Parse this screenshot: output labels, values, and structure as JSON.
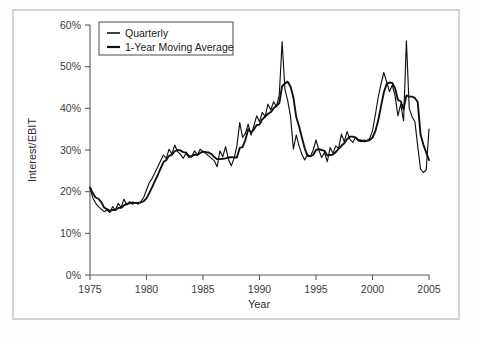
{
  "figure": {
    "background_color": "#ffffff",
    "frame_color": "#d3d3d5",
    "line_color": "#111111"
  },
  "chart_data": {
    "type": "line",
    "title": "",
    "xlabel": "Year",
    "ylabel": "Interest/EBIT",
    "xlim": [
      1975,
      2005
    ],
    "ylim": [
      0,
      60
    ],
    "grid": false,
    "legend_position": "top-left-inside",
    "xticks": [
      1975,
      1980,
      1985,
      1990,
      1995,
      2000,
      2005
    ],
    "xticklabels": [
      "1975",
      "1980",
      "1985",
      "1990",
      "1995",
      "2000",
      "2005"
    ],
    "yticks": [
      0,
      10,
      20,
      30,
      40,
      50,
      60
    ],
    "yticklabels": [
      "0%",
      "10%",
      "20%",
      "30%",
      "40%",
      "50%",
      "60%"
    ],
    "series": [
      {
        "name": "Quarterly",
        "linewidth": 1.15,
        "x": [
          1975.0,
          1975.25,
          1975.5,
          1975.75,
          1976.0,
          1976.25,
          1976.5,
          1976.75,
          1977.0,
          1977.25,
          1977.5,
          1977.75,
          1978.0,
          1978.25,
          1978.5,
          1978.75,
          1979.0,
          1979.25,
          1979.5,
          1979.75,
          1980.0,
          1980.25,
          1980.5,
          1980.75,
          1981.0,
          1981.25,
          1981.5,
          1981.75,
          1982.0,
          1982.25,
          1982.5,
          1982.75,
          1983.0,
          1983.25,
          1983.5,
          1983.75,
          1984.0,
          1984.25,
          1984.5,
          1984.75,
          1985.0,
          1985.25,
          1985.5,
          1985.75,
          1986.0,
          1986.25,
          1986.5,
          1986.75,
          1987.0,
          1987.25,
          1987.5,
          1987.75,
          1988.0,
          1988.25,
          1988.5,
          1988.75,
          1989.0,
          1989.25,
          1989.5,
          1989.75,
          1990.0,
          1990.25,
          1990.5,
          1990.75,
          1991.0,
          1991.25,
          1991.5,
          1991.75,
          1992.0,
          1992.25,
          1992.5,
          1992.75,
          1993.0,
          1993.25,
          1993.5,
          1993.75,
          1994.0,
          1994.25,
          1994.5,
          1994.75,
          1995.0,
          1995.25,
          1995.5,
          1995.75,
          1996.0,
          1996.25,
          1996.5,
          1996.75,
          1997.0,
          1997.25,
          1997.5,
          1997.75,
          1998.0,
          1998.25,
          1998.5,
          1998.75,
          1999.0,
          1999.25,
          1999.5,
          1999.75,
          2000.0,
          2000.25,
          2000.5,
          2000.75,
          2001.0,
          2001.25,
          2001.5,
          2001.75,
          2002.0,
          2002.25,
          2002.5,
          2002.75,
          2003.0,
          2003.25,
          2003.5,
          2003.75,
          2004.0,
          2004.25,
          2004.5,
          2004.75,
          2005.0
        ],
        "y": [
          21.0,
          18.5,
          17.2,
          16.4,
          15.8,
          15.2,
          15.6,
          15.0,
          16.4,
          15.6,
          17.2,
          16.2,
          18.2,
          16.8,
          17.6,
          17.0,
          17.4,
          17.0,
          17.6,
          18.6,
          20.4,
          22.2,
          23.2,
          24.6,
          26.0,
          27.4,
          28.8,
          28.0,
          30.2,
          29.0,
          31.2,
          29.6,
          29.0,
          28.0,
          29.2,
          28.2,
          28.4,
          29.8,
          28.8,
          30.2,
          29.6,
          29.2,
          28.6,
          28.0,
          27.4,
          26.0,
          29.8,
          28.4,
          30.8,
          27.8,
          26.2,
          28.0,
          31.0,
          36.6,
          33.0,
          34.0,
          36.2,
          33.6,
          35.8,
          38.2,
          36.8,
          39.0,
          38.0,
          41.0,
          39.6,
          41.6,
          40.4,
          43.2,
          56.0,
          44.6,
          41.8,
          38.0,
          30.2,
          33.6,
          31.0,
          29.0,
          27.6,
          29.0,
          28.4,
          30.0,
          32.4,
          30.0,
          28.2,
          29.4,
          27.2,
          30.6,
          29.2,
          31.0,
          30.4,
          33.8,
          32.0,
          34.4,
          32.6,
          31.8,
          33.0,
          32.2,
          32.0,
          32.4,
          32.2,
          32.8,
          34.6,
          38.4,
          42.6,
          45.8,
          48.6,
          46.4,
          44.0,
          45.6,
          43.0,
          38.2,
          41.0,
          37.0,
          56.2,
          40.0,
          38.0,
          36.8,
          31.0,
          25.4,
          24.6,
          25.2,
          35.0
        ]
      },
      {
        "name": "1-Year Moving Average",
        "linewidth": 1.9,
        "x": [
          1975.0,
          1975.25,
          1975.5,
          1975.75,
          1976.0,
          1976.25,
          1976.5,
          1976.75,
          1977.0,
          1977.25,
          1977.5,
          1977.75,
          1978.0,
          1978.25,
          1978.5,
          1978.75,
          1979.0,
          1979.25,
          1979.5,
          1979.75,
          1980.0,
          1980.25,
          1980.5,
          1980.75,
          1981.0,
          1981.25,
          1981.5,
          1981.75,
          1982.0,
          1982.25,
          1982.5,
          1982.75,
          1983.0,
          1983.25,
          1983.5,
          1983.75,
          1984.0,
          1984.25,
          1984.5,
          1984.75,
          1985.0,
          1985.25,
          1985.5,
          1985.75,
          1986.0,
          1986.25,
          1986.5,
          1986.75,
          1987.0,
          1987.25,
          1987.5,
          1987.75,
          1988.0,
          1988.25,
          1988.5,
          1988.75,
          1989.0,
          1989.25,
          1989.5,
          1989.75,
          1990.0,
          1990.25,
          1990.5,
          1990.75,
          1991.0,
          1991.25,
          1991.5,
          1991.75,
          1992.0,
          1992.25,
          1992.5,
          1992.75,
          1993.0,
          1993.25,
          1993.5,
          1993.75,
          1994.0,
          1994.25,
          1994.5,
          1994.75,
          1995.0,
          1995.25,
          1995.5,
          1995.75,
          1996.0,
          1996.25,
          1996.5,
          1996.75,
          1997.0,
          1997.25,
          1997.5,
          1997.75,
          1998.0,
          1998.25,
          1998.5,
          1998.75,
          1999.0,
          1999.25,
          1999.5,
          1999.75,
          2000.0,
          2000.25,
          2000.5,
          2000.75,
          2001.0,
          2001.25,
          2001.5,
          2001.75,
          2002.0,
          2002.25,
          2002.5,
          2002.75,
          2003.0,
          2003.25,
          2003.5,
          2003.75,
          2004.0,
          2004.25,
          2004.5,
          2004.75,
          2005.0
        ],
        "y": [
          21.0,
          19.6,
          18.6,
          18.3,
          17.5,
          16.2,
          15.8,
          15.4,
          15.6,
          15.6,
          16.1,
          16.1,
          16.7,
          17.1,
          17.2,
          17.4,
          17.3,
          17.3,
          17.4,
          17.7,
          18.4,
          19.7,
          21.1,
          22.6,
          24.0,
          25.6,
          27.1,
          27.6,
          28.6,
          28.9,
          29.7,
          30.0,
          29.9,
          29.5,
          29.4,
          28.6,
          28.5,
          28.9,
          28.8,
          29.3,
          29.6,
          29.5,
          29.4,
          29.0,
          28.3,
          27.8,
          27.8,
          27.9,
          28.0,
          28.2,
          28.3,
          28.2,
          28.2,
          30.5,
          30.7,
          32.4,
          35.0,
          34.2,
          34.9,
          36.0,
          36.1,
          37.4,
          38.0,
          38.7,
          39.1,
          40.0,
          40.6,
          41.2,
          45.3,
          46.0,
          46.4,
          45.2,
          42.6,
          37.9,
          35.7,
          33.0,
          30.4,
          28.6,
          28.5,
          28.8,
          30.0,
          30.2,
          30.0,
          29.8,
          28.7,
          28.8,
          28.9,
          29.5,
          30.3,
          31.0,
          31.6,
          32.6,
          33.2,
          33.2,
          33.0,
          32.4,
          32.3,
          32.1,
          32.2,
          32.4,
          33.0,
          34.5,
          37.0,
          40.4,
          43.8,
          45.8,
          46.2,
          46.1,
          44.8,
          42.0,
          41.7,
          39.8,
          43.1,
          42.8,
          42.8,
          42.5,
          41.5,
          33.8,
          31.3,
          29.4,
          27.6
        ]
      }
    ]
  }
}
